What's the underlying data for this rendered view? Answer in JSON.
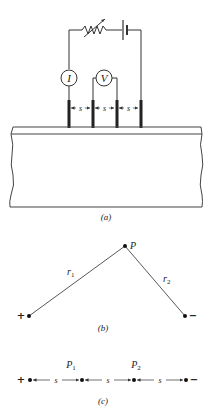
{
  "figure": {
    "panel_a": {
      "caption": "(a)",
      "ammeter_label": "I",
      "voltmeter_label": "V",
      "spacing_labels": [
        "s",
        "s",
        "s"
      ]
    },
    "panel_b": {
      "caption": "(b)",
      "point_label": "P",
      "r1_label": "r",
      "r1_sub": "1",
      "r2_label": "r",
      "r2_sub": "2",
      "plus_label": "+",
      "minus_label": "−"
    },
    "panel_c": {
      "caption": "(c)",
      "p1_label": "P",
      "p1_sub": "1",
      "p2_label": "P",
      "p2_sub": "2",
      "spacing_labels": [
        "s",
        "s",
        "s"
      ],
      "plus_label": "+",
      "minus_label": "−"
    }
  }
}
